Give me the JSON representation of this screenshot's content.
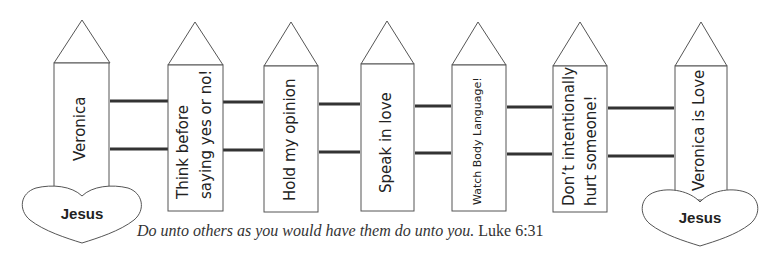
{
  "diagram": {
    "type": "picket-fence",
    "pickets": [
      {
        "id": 1,
        "lines": [
          "Veronica"
        ]
      },
      {
        "id": 2,
        "lines": [
          "Think before",
          "saying yes or no!"
        ]
      },
      {
        "id": 3,
        "lines": [
          "Hold my opinion"
        ]
      },
      {
        "id": 4,
        "lines": [
          "Speak in love"
        ]
      },
      {
        "id": 5,
        "lines": [
          "Watch Body Language!"
        ]
      },
      {
        "id": 6,
        "lines": [
          "Don’t intentionally",
          "hurt someone!"
        ]
      },
      {
        "id": 7,
        "lines": [
          "Veronica is Love"
        ]
      }
    ],
    "hearts": [
      {
        "position": "left",
        "label": "Jesus"
      },
      {
        "position": "right",
        "label": "Jesus"
      }
    ],
    "caption": {
      "quote": "Do unto others as you would have them do unto you.",
      "reference": "Luke 6:31"
    },
    "colors": {
      "stroke": "#555555",
      "rail": "#333333",
      "text": "#222222",
      "background": "#ffffff"
    }
  }
}
